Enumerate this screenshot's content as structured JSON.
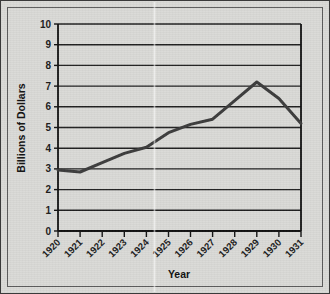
{
  "figure": {
    "background_color": "#d9d9d6",
    "border_color": "#3a3a3a",
    "line_color": "#3b3b3b",
    "axis_color": "#1a1a1a"
  },
  "chart_data": {
    "type": "line",
    "title": "",
    "xlabel": "Year",
    "ylabel": "Billions of Dollars",
    "categories": [
      "1920",
      "1921",
      "1922",
      "1923",
      "1924",
      "1925",
      "1926",
      "1927",
      "1928",
      "1929",
      "1930",
      "1931"
    ],
    "x": [
      1920,
      1921,
      1922,
      1923,
      1924,
      1925,
      1926,
      1927,
      1928,
      1929,
      1930,
      1931
    ],
    "values": [
      2.95,
      2.85,
      3.3,
      3.75,
      4.05,
      4.75,
      5.15,
      5.4,
      6.3,
      7.2,
      6.4,
      5.2
    ],
    "series": [
      {
        "name": "Billions of Dollars",
        "values": [
          2.95,
          2.85,
          3.3,
          3.75,
          4.05,
          4.75,
          5.15,
          5.4,
          6.3,
          7.2,
          6.4,
          5.2
        ]
      }
    ],
    "xlim": [
      1920,
      1931
    ],
    "ylim": [
      0,
      10
    ],
    "ytick_labels": [
      "0",
      "1",
      "2",
      "3",
      "4",
      "5",
      "6",
      "7",
      "8",
      "9",
      "10"
    ],
    "ytick_values": [
      0,
      1,
      2,
      3,
      4,
      5,
      6,
      7,
      8,
      9,
      10
    ],
    "xtick_labels": [
      "1920",
      "1921",
      "1922",
      "1923",
      "1924",
      "1925",
      "1926",
      "1927",
      "1928",
      "1929",
      "1930",
      "1931"
    ],
    "xtick_rotation": -45,
    "grid": {
      "horizontal": true,
      "vertical": false
    },
    "legend": {
      "visible": false,
      "position": "none"
    },
    "markers": false,
    "line_width": 3
  }
}
